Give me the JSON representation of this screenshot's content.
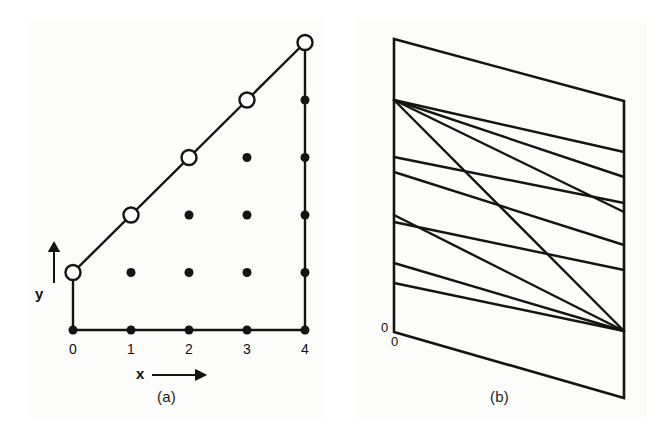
{
  "figure": {
    "width": 666,
    "height": 438,
    "background": "#ffffff",
    "ink_color": "#141414"
  },
  "panel_a": {
    "caption": "(a)",
    "x_axis_label": "x",
    "y_axis_label": "y",
    "x_tick_labels": [
      "0",
      "1",
      "2",
      "3",
      "4"
    ],
    "origin_px": {
      "x": 73,
      "y": 330
    },
    "step_px": {
      "x": 58,
      "y": 57.5
    },
    "open_marker_radius": 7.5,
    "filled_marker_radius": 4.5,
    "boundary_open_points": [
      {
        "x": 0,
        "y": 1
      },
      {
        "x": 1,
        "y": 2
      },
      {
        "x": 2,
        "y": 3
      },
      {
        "x": 3,
        "y": 4
      },
      {
        "x": 4,
        "y": 5
      }
    ],
    "filled_points": [
      {
        "x": 0,
        "y": 0
      },
      {
        "x": 1,
        "y": 0
      },
      {
        "x": 2,
        "y": 0
      },
      {
        "x": 3,
        "y": 0
      },
      {
        "x": 4,
        "y": 0
      },
      {
        "x": 1,
        "y": 1
      },
      {
        "x": 2,
        "y": 1
      },
      {
        "x": 3,
        "y": 1
      },
      {
        "x": 4,
        "y": 1
      },
      {
        "x": 2,
        "y": 2
      },
      {
        "x": 3,
        "y": 2
      },
      {
        "x": 4,
        "y": 2
      },
      {
        "x": 3,
        "y": 3
      },
      {
        "x": 4,
        "y": 3
      },
      {
        "x": 4,
        "y": 4
      }
    ],
    "left_edge": {
      "from": {
        "x": 0,
        "y": 0
      },
      "to": {
        "x": 0,
        "y": 1
      }
    },
    "bottom_edge": {
      "from": {
        "x": 0,
        "y": 0
      },
      "to": {
        "x": 4,
        "y": 0
      }
    },
    "right_edge": {
      "from": {
        "x": 4,
        "y": 0
      },
      "to": {
        "x": 4,
        "y": 5
      }
    },
    "diagonal_edge": {
      "from": {
        "x": 0,
        "y": 1
      },
      "to": {
        "x": 4,
        "y": 5
      }
    }
  },
  "panel_b": {
    "caption": "(b)",
    "origin_label_left": "0",
    "origin_label_bottom": "0",
    "outer_quad": [
      {
        "x": 61,
        "y": 39
      },
      {
        "x": 291,
        "y": 101
      },
      {
        "x": 291,
        "y": 398
      },
      {
        "x": 61,
        "y": 332
      }
    ],
    "fan_origin_left": {
      "x": 61,
      "y": 100
    },
    "fan_origin_right": {
      "x": 291,
      "y": 331
    },
    "lines_from_left_fan": [
      {
        "x1": 61,
        "y1": 100,
        "x2": 291,
        "y2": 152
      },
      {
        "x1": 61,
        "y1": 100,
        "x2": 291,
        "y2": 177
      },
      {
        "x1": 61,
        "y1": 100,
        "x2": 291,
        "y2": 212
      },
      {
        "x1": 61,
        "y1": 100,
        "x2": 291,
        "y2": 331
      }
    ],
    "lines_from_left_mid": [
      {
        "x1": 61,
        "y1": 157,
        "x2": 291,
        "y2": 203
      },
      {
        "x1": 61,
        "y1": 172,
        "x2": 291,
        "y2": 245
      }
    ],
    "lines_to_right_fan": [
      {
        "x1": 61,
        "y1": 215,
        "x2": 291,
        "y2": 331
      },
      {
        "x1": 61,
        "y1": 222,
        "x2": 291,
        "y2": 270
      },
      {
        "x1": 61,
        "y1": 263,
        "x2": 291,
        "y2": 331
      },
      {
        "x1": 61,
        "y1": 283,
        "x2": 291,
        "y2": 331
      }
    ]
  }
}
